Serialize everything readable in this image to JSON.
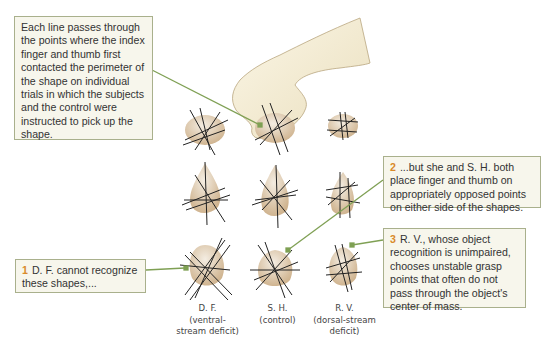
{
  "callouts": {
    "intro": {
      "text": "Each line passes through the points where the index finger and thumb first contacted the perimeter of the shape on individual trials in which the subjects and the control were instructed to pick up the shape."
    },
    "c1": {
      "number": "1",
      "text": "D. F. cannot recognize these shapes,..."
    },
    "c2": {
      "number": "2",
      "text": "...but she and S. H. both place finger and thumb on appropriately opposed points on either side of the shapes."
    },
    "c3": {
      "number": "3",
      "text": "R. V., whose object recognition is unimpaired, chooses unstable grasp points that often do not pass through the object's center of mass."
    }
  },
  "columns": [
    {
      "name": "D. F.",
      "desc": "(ventral-stream deficit)"
    },
    {
      "name": "S. H.",
      "desc": "(control)"
    },
    {
      "name": "R. V.",
      "desc": "(dorsal-stream deficit)"
    }
  ],
  "colors": {
    "callout_bg": "#f7f6ec",
    "callout_border": "#a9b08c",
    "leader": "#7fa054",
    "number": "#d98a2a",
    "shape": "#d9c2a4"
  }
}
